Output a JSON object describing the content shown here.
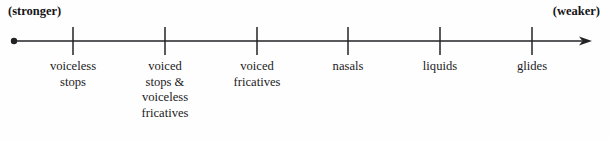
{
  "figure": {
    "type": "sonority-scale-number-line",
    "endpoints": {
      "left_label": "(stronger)",
      "right_label": "(weaker)"
    },
    "axis": {
      "start_x": 14,
      "end_x": 592,
      "y": 41,
      "start_cap": "dot",
      "end_cap": "arrowhead",
      "line_color": "#232326",
      "line_width": 1.6
    },
    "ticks": [
      {
        "x": 73,
        "label": "voiceless\nstops"
      },
      {
        "x": 165,
        "label": "voiced\nstops &\nvoiceless\nfricatives"
      },
      {
        "x": 257,
        "label": "voiced\nfricatives"
      },
      {
        "x": 348,
        "label": "nasals"
      },
      {
        "x": 440,
        "label": "liquids"
      },
      {
        "x": 532,
        "label": "glides"
      }
    ]
  },
  "chart_data": {
    "type": "line",
    "title": "",
    "subtitle": "",
    "xlabel": "",
    "ylabel": "",
    "grid": false,
    "legend": "none",
    "axis_direction": "left-to-right",
    "axis_start_annotation": "(stronger)",
    "axis_end_annotation": "(weaker)",
    "categories": [
      "voiceless stops",
      "voiced stops & voiceless fricatives",
      "voiced fricatives",
      "nasals",
      "liquids",
      "glides"
    ],
    "values": [
      1,
      2,
      3,
      4,
      5,
      6
    ],
    "tick_positions_px": [
      73,
      165,
      257,
      348,
      440,
      532
    ],
    "xlim": [
      14,
      592
    ]
  }
}
